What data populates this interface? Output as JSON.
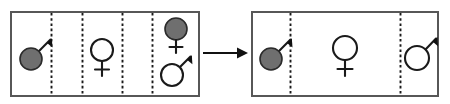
{
  "figure": {
    "type": "diagram",
    "canvas": {
      "width": 450,
      "height": 104
    },
    "colors": {
      "background": "#ffffff",
      "panel_border": "#575757",
      "divider": "#1a1a1a",
      "symbol_stroke": "#1a1a1a",
      "symbol_fill_filled": "#6f6f6f",
      "symbol_fill_open": "#ffffff",
      "arrow": "#111111"
    },
    "panels": [
      {
        "id": "panel-left",
        "name": "left-panel",
        "x": 11,
        "y": 12,
        "width": 188,
        "height": 84,
        "dividers_x": [
          51,
          82,
          122,
          152
        ],
        "compartments": [
          {
            "id": "left-compartment-1",
            "symbols": [
              {
                "glyph": "male",
                "fill": "filled",
                "cx": 31,
                "cy": 59,
                "r": 11
              }
            ]
          },
          {
            "id": "left-compartment-2",
            "symbols": []
          },
          {
            "id": "left-compartment-3",
            "symbols": [
              {
                "glyph": "female",
                "fill": "open",
                "cx": 102,
                "cy": 50,
                "r": 11
              }
            ]
          },
          {
            "id": "left-compartment-4",
            "symbols": []
          },
          {
            "id": "left-compartment-5",
            "symbols": [
              {
                "glyph": "female",
                "fill": "filled",
                "cx": 176,
                "cy": 30,
                "r": 11
              },
              {
                "glyph": "male",
                "fill": "open",
                "cx": 172,
                "cy": 73,
                "r": 11
              }
            ]
          }
        ]
      },
      {
        "id": "panel-right",
        "name": "right-panel",
        "x": 252,
        "y": 12,
        "width": 186,
        "height": 84,
        "dividers_x": [
          290,
          400
        ],
        "compartments": [
          {
            "id": "right-compartment-1",
            "symbols": [
              {
                "glyph": "male",
                "fill": "filled",
                "cx": 271,
                "cy": 59,
                "r": 11
              }
            ]
          },
          {
            "id": "right-compartment-2",
            "symbols": [
              {
                "glyph": "female",
                "fill": "open",
                "cx": 345,
                "cy": 49,
                "r": 12
              }
            ]
          },
          {
            "id": "right-compartment-3",
            "symbols": [
              {
                "glyph": "male",
                "fill": "open",
                "cx": 417,
                "cy": 58,
                "r": 12
              }
            ]
          }
        ]
      }
    ],
    "arrow": {
      "id": "transition-arrow",
      "direction": "right",
      "x1": 203,
      "x2": 248,
      "y": 53
    },
    "symbol_names": {
      "male": "mars-symbol",
      "female": "venus-symbol"
    },
    "legend": {
      "filled_meaning": "filled-gray-symbol",
      "open_meaning": "open-white-symbol"
    }
  }
}
